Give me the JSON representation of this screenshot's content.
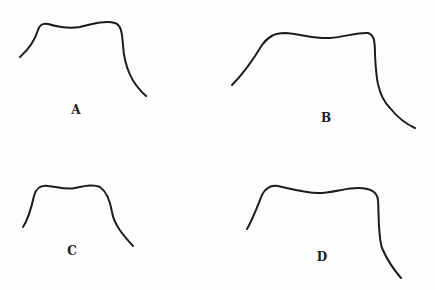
{
  "figure": {
    "panels": [
      {
        "id": "A",
        "label": "A",
        "label_pos": [
          76,
          110
        ],
        "path": "M20,57 C30,48 35,40 38,30 C40,24 43,23 48,24 C58,27 68,29 80,27 C92,24 105,20 115,23 C121,25 122,32 123,45 C124,62 130,82 146,96"
      },
      {
        "id": "B",
        "label": "B",
        "label_pos": [
          326,
          118
        ],
        "path": "M232,85 C245,72 253,60 262,45 C268,37 274,33 285,33 C300,34 315,39 330,38 C345,37 358,32 368,33 C374,35 375,40 375,55 C376,75 377,95 390,108 C398,118 406,124 415,128"
      },
      {
        "id": "C",
        "label": "C",
        "label_pos": [
          72,
          251
        ],
        "path": "M23,227 C29,218 32,205 34,196 C36,188 40,185 48,186 C58,187 66,190 75,188 C85,186 93,184 100,187 C107,192 110,200 112,212 C114,225 124,236 133,246"
      },
      {
        "id": "D",
        "label": "D",
        "label_pos": [
          322,
          257
        ],
        "path": "M247,229 C253,219 258,205 262,195 C266,187 271,185 278,186 C292,189 305,193 318,193 C332,193 345,188 358,188 C368,188 377,190 378,200 C379,215 378,235 382,248 C388,262 394,270 401,278"
      }
    ]
  }
}
